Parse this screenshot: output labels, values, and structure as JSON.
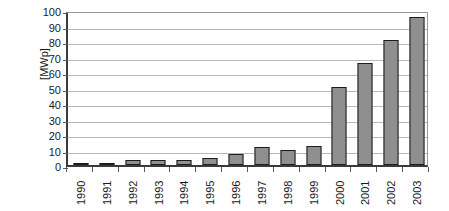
{
  "chart_data": {
    "type": "bar",
    "title": "",
    "subtitle": "",
    "xlabel": "",
    "ylabel": "[MWp]",
    "categories": [
      "1990",
      "1991",
      "1992",
      "1993",
      "1994",
      "1995",
      "1996",
      "1997",
      "1998",
      "1999",
      "2000",
      "2001",
      "2002",
      "2003"
    ],
    "values": [
      0.5,
      1.0,
      3.0,
      3.2,
      3.2,
      4.3,
      7.3,
      11.5,
      9.5,
      12.0,
      50.6,
      65.8,
      80.8,
      95.7
    ],
    "ylim": [
      0,
      100
    ],
    "ytick_values": [
      0,
      10,
      20,
      30,
      40,
      50,
      60,
      70,
      80,
      90,
      100
    ],
    "ytick_labels": [
      "0",
      "10",
      "20",
      "30",
      "40",
      "50",
      "60",
      "70",
      "80",
      "90",
      "100"
    ],
    "grid": true,
    "grid_axis": "y",
    "legend": false,
    "legend_position": "none",
    "series": [
      {
        "name": "",
        "values": [
          0.5,
          1.0,
          3.0,
          3.2,
          3.2,
          4.3,
          7.3,
          11.5,
          9.5,
          12.0,
          50.6,
          65.8,
          80.8,
          95.7
        ]
      }
    ],
    "colors": {
      "bar_fill": "#8f8f8f",
      "bar_edge": "#1c1c1c",
      "plot_background": "#ffffff",
      "gridline": "#b9b9b9",
      "axis": "#3a3a3a",
      "text": "#1a1a1a"
    }
  }
}
